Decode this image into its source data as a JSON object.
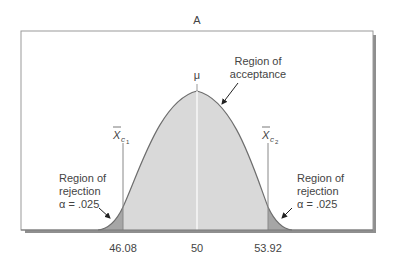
{
  "figure": {
    "panel_label": "A",
    "mu_label": "μ",
    "xc1_label": "X",
    "xc1_sub": "c",
    "xc1_subsub": "1",
    "xc2_label": "X",
    "xc2_sub": "c",
    "xc2_subsub": "2",
    "acceptance": {
      "line1": "Region of",
      "line2": "acceptance"
    },
    "left_rejection": {
      "line1": "Region of",
      "line2": "rejection",
      "line3": "α = .025"
    },
    "right_rejection": {
      "line1": "Region of",
      "line2": "rejection",
      "line3": "α = .025"
    },
    "ticks": {
      "left": "46.08",
      "center": "50",
      "right": "53.92"
    },
    "colors": {
      "acceptance_fill": "#d9d9d9",
      "rejection_fill": "#a6a6a6",
      "curve": "#6e6e6e",
      "frame": "#8a8a8a",
      "shadow": "#8c8c8c"
    }
  }
}
